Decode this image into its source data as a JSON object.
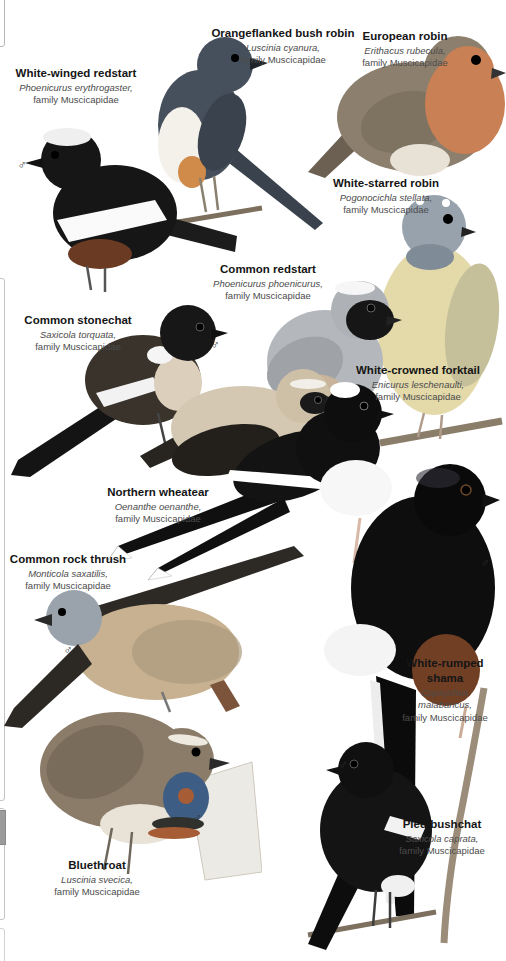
{
  "page": {
    "background": "#ffffff",
    "male_symbol": "♂"
  },
  "species": [
    {
      "id": "orangeflanked-bush-robin",
      "common_name": "Orangeflanked bush robin",
      "scientific_name": "Luscinia cyanura,",
      "family": "family Muscicapidae",
      "sex": "",
      "body_color": "#46505c"
    },
    {
      "id": "european-robin",
      "common_name": "European robin",
      "scientific_name": "Erithacus rubecula,",
      "family": "family Muscicapidae",
      "sex": "",
      "body_color": "#8d7f6d"
    },
    {
      "id": "white-winged-redstart",
      "common_name": "White-winged redstart",
      "scientific_name": "Phoenicurus erythrogaster,",
      "family": "family Muscicapidae",
      "sex": "♂",
      "body_color": "#161616"
    },
    {
      "id": "white-starred-robin",
      "common_name": "White-starred robin",
      "scientific_name": "Pogonocichla stellata,",
      "family": "family Muscicapidae",
      "sex": "",
      "body_color": "#e3d9a9"
    },
    {
      "id": "common-redstart",
      "common_name": "Common redstart",
      "scientific_name": "Phoenicurus phoenicurus,",
      "family": "family Muscicapidae",
      "sex": "♂",
      "body_color": "#b4b8bc"
    },
    {
      "id": "common-stonechat",
      "common_name": "Common stonechat",
      "scientific_name": "Saxicola torquata,",
      "family": "family Muscicapidae",
      "sex": "♂",
      "body_color": "#3a332b"
    },
    {
      "id": "white-crowned-forktail",
      "common_name": "White-crowned forktail",
      "scientific_name": "Enicurus leschenaulti,",
      "family": "family Muscicapidae",
      "sex": "",
      "body_color": "#101010"
    },
    {
      "id": "northern-wheatear",
      "common_name": "Northern wheatear",
      "scientific_name": "Oenanthe oenanthe,",
      "family": "family Muscicapidae",
      "sex": "",
      "body_color": "#d5c8b2"
    },
    {
      "id": "common-rock-thrush",
      "common_name": "Common rock thrush",
      "scientific_name": "Monticola saxatilis,",
      "family": "family Muscicapidae",
      "sex": "♂",
      "body_color": "#c7b190"
    },
    {
      "id": "white-rumped-shama",
      "common_name": "White-rumped shama",
      "scientific_name": "Copsychus malabaricus,",
      "family": "family Muscicapidae",
      "sex": "♂",
      "body_color": "#0e0e0e"
    },
    {
      "id": "bluethroat",
      "common_name": "Bluethroat",
      "scientific_name": "Luscinia svecica,",
      "family": "family Muscicapidae",
      "sex": "♂",
      "body_color": "#8b7c69"
    },
    {
      "id": "pied-bushchat",
      "common_name": "Pied bushchat",
      "scientific_name": "Saxicola caprata,",
      "family": "family Muscicapidae",
      "sex": "♂",
      "body_color": "#141414"
    }
  ]
}
